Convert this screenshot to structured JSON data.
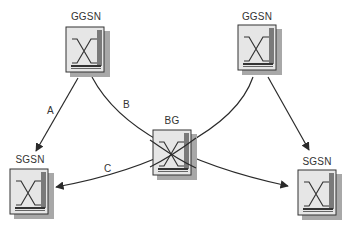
{
  "diagram": {
    "nodes": [
      {
        "id": "ggsn-left",
        "label": "GGSN",
        "x": 66,
        "y": 27
      },
      {
        "id": "ggsn-right",
        "label": "GGSN",
        "x": 238,
        "y": 25
      },
      {
        "id": "bg",
        "label": "BG",
        "x": 153,
        "y": 130
      },
      {
        "id": "sgsn-left",
        "label": "SGSN",
        "x": 10,
        "y": 169
      },
      {
        "id": "sgsn-right",
        "label": "SGSN",
        "x": 298,
        "y": 170
      }
    ],
    "edges": [
      {
        "from": "ggsn-left",
        "to": "sgsn-left",
        "label": "A"
      },
      {
        "from": "ggsn-left",
        "to": "sgsn-right",
        "label": "B",
        "via": "bg"
      },
      {
        "from": "ggsn-right",
        "to": "sgsn-left",
        "label": "C",
        "via": "bg"
      },
      {
        "from": "ggsn-right",
        "to": "sgsn-right",
        "label": ""
      }
    ],
    "edge_labels": {
      "a": "A",
      "b": "B",
      "c": "C"
    },
    "colors": {
      "line": "#2a2a2a",
      "box_face": "#e4e4e4",
      "box_shadow": "#9a9a9a",
      "box_border": "#333333"
    }
  }
}
